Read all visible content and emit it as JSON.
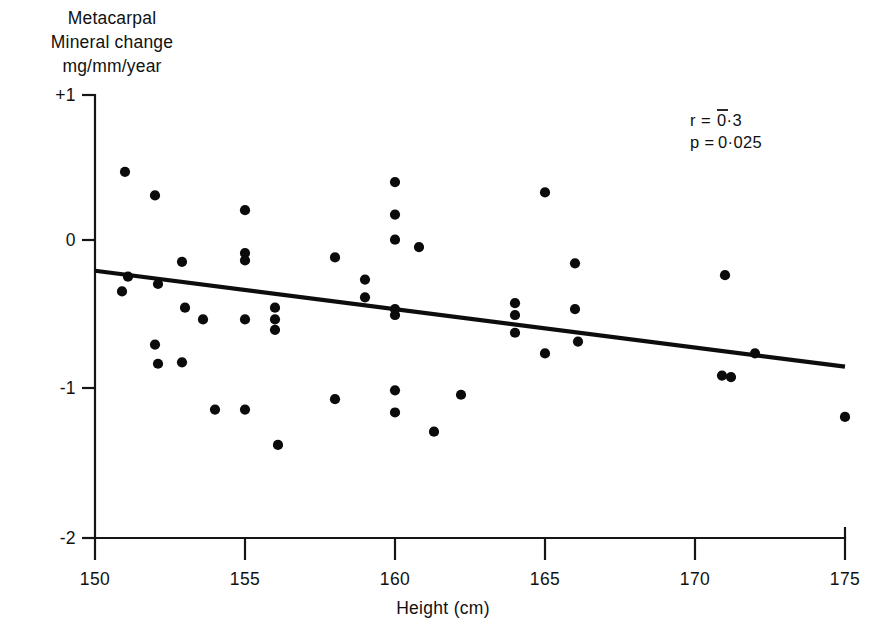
{
  "figure": {
    "background_color": "#ffffff",
    "ink_color": "#111111"
  },
  "ylabel_lines": {
    "line1": "Metacarpal",
    "line2": "Mineral change",
    "line3": "mg/mm/year"
  },
  "axis_title_x": "Height (cm)",
  "annotations": {
    "r_text": "r = 0·3",
    "r_prefix": "r =",
    "r_value": "0·3",
    "p_text": "p = 0·025",
    "p_prefix": "p =",
    "p_value": "0·025",
    "r_note": "r value is negative, shown with an overbar above the leading zero"
  },
  "y_ticks": [
    "+1",
    "0",
    "-1",
    "-2"
  ],
  "x_ticks": [
    "150",
    "155",
    "160",
    "165",
    "170",
    "175"
  ],
  "chart_data": {
    "type": "scatter",
    "title": "",
    "xlabel": "Height (cm)",
    "ylabel": "Metacarpal Mineral change mg/mm/year",
    "xlim": [
      150,
      175
    ],
    "ylim": [
      -2,
      1
    ],
    "xticks": [
      150,
      155,
      160,
      165,
      170,
      175
    ],
    "yticks": [
      -2,
      -1,
      0,
      1
    ],
    "ytick_labels": [
      "-2",
      "-1",
      "0",
      "+1"
    ],
    "grid": false,
    "legend": null,
    "marker": "filled-circle",
    "marker_color": "#0b0b0b",
    "points": [
      {
        "x": 151.0,
        "y": 0.48
      },
      {
        "x": 151.1,
        "y": -0.23
      },
      {
        "x": 150.9,
        "y": -0.33
      },
      {
        "x": 152.0,
        "y": 0.32
      },
      {
        "x": 152.1,
        "y": -0.28
      },
      {
        "x": 152.0,
        "y": -0.69
      },
      {
        "x": 152.1,
        "y": -0.82
      },
      {
        "x": 152.9,
        "y": -0.13
      },
      {
        "x": 153.0,
        "y": -0.44
      },
      {
        "x": 152.9,
        "y": -0.81
      },
      {
        "x": 153.6,
        "y": -0.52
      },
      {
        "x": 154.0,
        "y": -1.13
      },
      {
        "x": 155.0,
        "y": 0.22
      },
      {
        "x": 155.0,
        "y": -0.07
      },
      {
        "x": 155.0,
        "y": -0.12
      },
      {
        "x": 155.0,
        "y": -0.52
      },
      {
        "x": 155.0,
        "y": -1.13
      },
      {
        "x": 156.0,
        "y": -0.44
      },
      {
        "x": 156.0,
        "y": -0.52
      },
      {
        "x": 156.0,
        "y": -0.59
      },
      {
        "x": 156.1,
        "y": -1.37
      },
      {
        "x": 158.0,
        "y": -0.1
      },
      {
        "x": 158.0,
        "y": -1.06
      },
      {
        "x": 159.0,
        "y": -0.25
      },
      {
        "x": 159.0,
        "y": -0.37
      },
      {
        "x": 160.0,
        "y": 0.41
      },
      {
        "x": 160.0,
        "y": 0.19
      },
      {
        "x": 160.0,
        "y": 0.02
      },
      {
        "x": 160.0,
        "y": -0.45
      },
      {
        "x": 160.0,
        "y": -0.49
      },
      {
        "x": 160.0,
        "y": -1.0
      },
      {
        "x": 160.0,
        "y": -1.15
      },
      {
        "x": 160.8,
        "y": -0.03
      },
      {
        "x": 161.3,
        "y": -1.28
      },
      {
        "x": 162.2,
        "y": -1.03
      },
      {
        "x": 164.0,
        "y": -0.41
      },
      {
        "x": 164.0,
        "y": -0.49
      },
      {
        "x": 164.0,
        "y": -0.61
      },
      {
        "x": 165.0,
        "y": 0.34
      },
      {
        "x": 165.0,
        "y": -0.75
      },
      {
        "x": 166.0,
        "y": -0.14
      },
      {
        "x": 166.0,
        "y": -0.45
      },
      {
        "x": 166.1,
        "y": -0.67
      },
      {
        "x": 171.0,
        "y": -0.22
      },
      {
        "x": 170.9,
        "y": -0.9
      },
      {
        "x": 171.2,
        "y": -0.91
      },
      {
        "x": 172.0,
        "y": -0.75
      },
      {
        "x": 175.0,
        "y": -1.18
      }
    ],
    "fit_line": {
      "type": "linear-regression",
      "x_start": 150.0,
      "y_start": -0.19,
      "x_end": 175.0,
      "y_end": -0.84
    },
    "annotations": [
      {
        "text": "r = ¯0·3",
        "x": 170.0,
        "y": 0.62
      },
      {
        "text": "p = 0·025",
        "x": 170.0,
        "y": 0.48
      }
    ]
  }
}
